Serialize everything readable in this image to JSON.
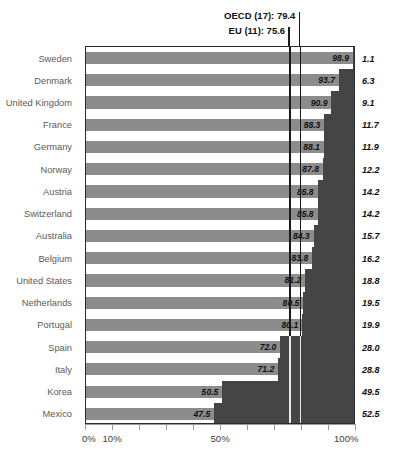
{
  "chart_data": {
    "type": "bar",
    "title": "",
    "xlabel": "",
    "ylabel": "",
    "orientation": "horizontal",
    "xlim": [
      0,
      100
    ],
    "grid": false,
    "legend": "none",
    "tick_labels": [
      "0%",
      "10%",
      "50%",
      "100%"
    ],
    "tick_values": [
      0,
      10,
      50,
      100
    ],
    "tick_marks_every": 10,
    "categories": [
      "Sweden",
      "Denmark",
      "United Kingdom",
      "France",
      "Germany",
      "Norway",
      "Austria",
      "Switzerland",
      "Australia",
      "Belgium",
      "United States",
      "Netherlands",
      "Portugal",
      "Spain",
      "Italy",
      "Korea",
      "Mexico"
    ],
    "values": [
      98.9,
      93.7,
      90.9,
      88.3,
      88.1,
      87.8,
      85.8,
      85.8,
      84.3,
      83.8,
      81.2,
      80.5,
      80.1,
      72.0,
      71.2,
      50.5,
      47.5
    ],
    "complement_values": [
      1.1,
      6.3,
      9.1,
      11.7,
      11.9,
      12.2,
      14.2,
      14.2,
      15.7,
      16.2,
      18.8,
      19.5,
      19.9,
      28.0,
      28.8,
      49.5,
      52.5
    ],
    "reference_lines": [
      {
        "label": "OECD (17): 79.4",
        "value": 79.4
      },
      {
        "label": "EU (11): 75.6",
        "value": 75.6
      }
    ],
    "colors": {
      "bar": "#8c8c8c",
      "remainder": "#454545",
      "axis": "#9a9a9a",
      "label_text": "#5a5a5a",
      "value_text": "#111111",
      "reference_line": "#1a1a1a"
    }
  },
  "annotations": {
    "oecd": "OECD (17): 79.4",
    "eu": "EU (11): 75.6"
  },
  "axis": {
    "labels": [
      "0%",
      "10%",
      "50%",
      "100%"
    ]
  }
}
